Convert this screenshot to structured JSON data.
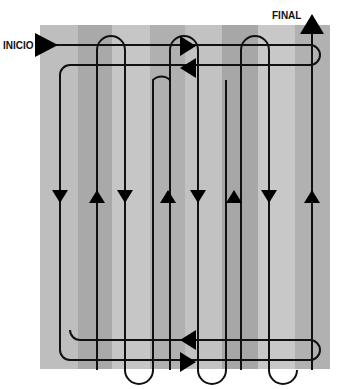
{
  "labels": {
    "start": "INICIO",
    "end": "FINAL"
  },
  "diagram": {
    "type": "field traversal path pattern",
    "columns": 8,
    "background_colors": [
      "#bdbdbd",
      "#a6a6a6",
      "#c4c4c4",
      "#acacac"
    ],
    "path_color": "#111111"
  }
}
